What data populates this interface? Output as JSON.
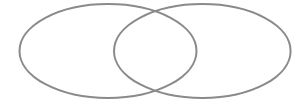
{
  "diagram": {
    "type": "venn",
    "sets": [
      {
        "id": "left",
        "label": "",
        "cx": 108,
        "cy": 51,
        "rx": 88.5,
        "ry": 47
      },
      {
        "id": "right",
        "label": "",
        "cx": 202.3,
        "cy": 51,
        "rx": 88.3,
        "ry": 47
      }
    ],
    "stroke_color": "#8a8a8a",
    "fill_color": "none",
    "background": "#ffffff"
  }
}
